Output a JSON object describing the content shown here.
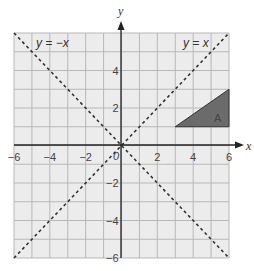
{
  "graph": {
    "x_range": [
      -6,
      6
    ],
    "y_range": [
      -6,
      6
    ],
    "grid_step": 1,
    "x_axis_label": "x",
    "y_axis_label": "y",
    "x_ticks": [
      {
        "value": -6,
        "label": "−6"
      },
      {
        "value": -4,
        "label": "−4"
      },
      {
        "value": -2,
        "label": "−2"
      },
      {
        "value": 2,
        "label": "2"
      },
      {
        "value": 4,
        "label": "4"
      },
      {
        "value": 6,
        "label": "6"
      }
    ],
    "y_ticks": [
      {
        "value": 4,
        "label": "4"
      },
      {
        "value": 2,
        "label": "2"
      },
      {
        "value": -2,
        "label": "−2"
      },
      {
        "value": -4,
        "label": "−4"
      },
      {
        "value": -6,
        "label": "−6"
      }
    ],
    "origin_label": "0",
    "lines": [
      {
        "equation": "y = −x",
        "style": "dashed"
      },
      {
        "equation": "y = x",
        "style": "dashed"
      }
    ],
    "triangle": {
      "label": "A",
      "vertices": [
        [
          3,
          1
        ],
        [
          6,
          1
        ],
        [
          6,
          3
        ]
      ],
      "fill": "#6b6b6b"
    },
    "colors": {
      "background": "#ececec",
      "grid": "#b8b8b8",
      "axis": "#222222",
      "dash": "#333333"
    }
  }
}
